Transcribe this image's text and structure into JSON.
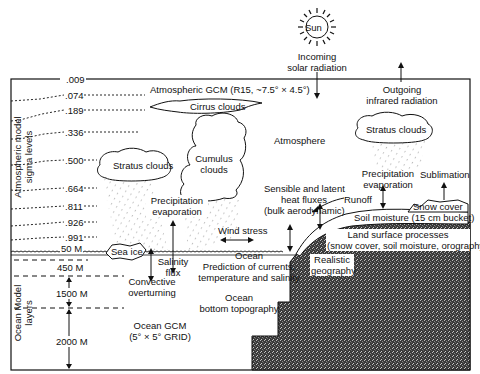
{
  "sun": {
    "label": "Sun"
  },
  "incoming": {
    "line1": "Incoming",
    "line2": "solar radiation"
  },
  "outgoing": {
    "line1": "Outgoing",
    "line2": "infrared radiation"
  },
  "atm_gcm": "Atmospheric GCM (R15, ~7.5° × 4.5°)",
  "sigma_axis": {
    "line1": "Atmospheric model",
    "line2": "sigma levels"
  },
  "sigma_levels": [
    ".009",
    ".074",
    ".189",
    ".336",
    ".500",
    ".664",
    ".811",
    ".926",
    ".991"
  ],
  "clouds": {
    "cirrus": "Cirrus clouds",
    "stratus_left": "Stratus clouds",
    "cumulus": {
      "line1": "Cumulus",
      "line2": "clouds"
    },
    "stratus_right": "Stratus clouds"
  },
  "atmosphere": "Atmosphere",
  "precip_left": {
    "line1": "Precipitation",
    "line2": "evaporation"
  },
  "precip_right": {
    "line1": "Precipitation",
    "line2": "evaporation"
  },
  "sublimation": "Sublimation",
  "fluxes": {
    "line1": "Sensible and latent",
    "line2": "heat fluxes",
    "line3": "(bulk aerodynamic)"
  },
  "wind_stress": "Wind stress",
  "runoff": "Runoff",
  "snow_cover": "Snow cover",
  "soil_moisture": "Soil moisture (15 cm bucket)",
  "land_surface": {
    "line1": "Land surface processes",
    "line2": "(snow cover, soil moisture, orography)"
  },
  "realistic_geo": {
    "line1": "Realistic",
    "line2": "geography"
  },
  "sea_ice": "Sea ice",
  "salinity": {
    "line1": "Salinity",
    "line2": "flux"
  },
  "convective": {
    "line1": "Convective",
    "line2": "overturning"
  },
  "ocean_pred": {
    "line1": "Ocean",
    "line2": "Prediction of currents,",
    "line3": "temperature and salinity"
  },
  "ocean_bottom": {
    "line1": "Ocean",
    "line2": "bottom topography"
  },
  "ocean_gcm": {
    "line1": "Ocean GCM",
    "line2": "(5° × 5° GRID)"
  },
  "ocean_layers_axis": {
    "line1": "Ocean Model",
    "line2": "layers"
  },
  "ocean_depths": [
    "50 M",
    "450 M",
    "1500 M",
    "2000 M"
  ]
}
